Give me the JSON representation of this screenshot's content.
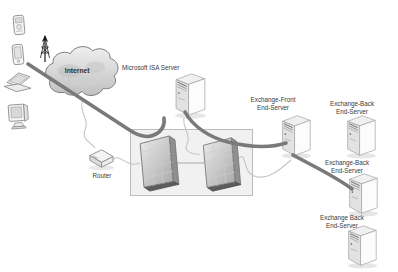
{
  "nodes": {
    "internet": {
      "label": "Internet"
    },
    "isa_server": {
      "label": "Microsoft ISA Server"
    },
    "router": {
      "label": "Router"
    },
    "exchange_front": {
      "label": "Exchange-Front\nEnd-Server"
    },
    "exchange_back_top": {
      "label": "Exchange-Back\nEnd-Server"
    },
    "exchange_back_middle": {
      "label": "Exchange-Back\nEnd-Server"
    },
    "exchange_back_bottom": {
      "label": "Exchange Back\nEnd-Server"
    }
  },
  "icons": {
    "client_devices": [
      "mobile-phone-icon",
      "pda-icon",
      "laptop-icon",
      "desktop-monitor-icon"
    ],
    "antenna": "antenna-icon",
    "cloud": "internet-cloud-icon",
    "server": "server-tower-icon",
    "firewall": "firewall-icon",
    "router": "router-icon"
  },
  "colors": {
    "background": "#ffffff",
    "thick_connection": "#7a7a7a",
    "thin_connection": "#c6c6c6",
    "dmz_fill": "#f1f1f1",
    "dmz_border": "#bcbcbc",
    "cloud_fill": "#d9d9d9",
    "label_text": "#3a3a3a"
  }
}
